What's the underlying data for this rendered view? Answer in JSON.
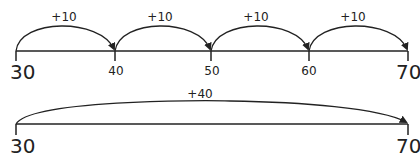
{
  "diagram": {
    "type": "number_line_jumps",
    "colors": {
      "line": "#222222",
      "text": "#222222",
      "background": "#ffffff"
    },
    "top_line": {
      "start_label": "30",
      "ticks": [
        "30",
        "40",
        "50",
        "60",
        "70"
      ],
      "end_label": "70",
      "jumps": [
        {
          "from": "30",
          "to": "40",
          "label": "+10"
        },
        {
          "from": "40",
          "to": "50",
          "label": "+10"
        },
        {
          "from": "50",
          "to": "60",
          "label": "+10"
        },
        {
          "from": "60",
          "to": "70",
          "label": "+10"
        }
      ]
    },
    "bottom_line": {
      "start_label": "30",
      "end_label": "70",
      "jump": {
        "from": "30",
        "to": "70",
        "label": "+40"
      }
    }
  }
}
